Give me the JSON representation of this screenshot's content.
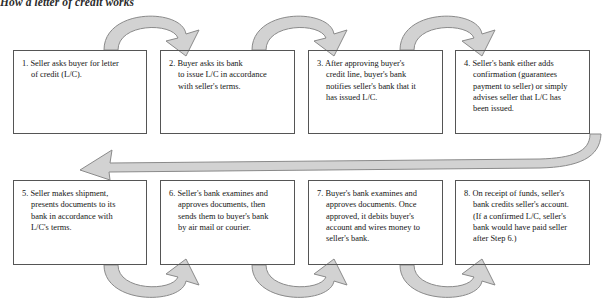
{
  "title": "How a letter of credit works",
  "colors": {
    "arrow_fill": "#d2d2d2",
    "arrow_stroke": "#8a8a8a",
    "box_border": "#555555",
    "text": "#141414",
    "background": "#ffffff"
  },
  "steps": [
    {
      "number": "1.",
      "text": "1. Seller asks buyer for letter\n of credit (L/C)."
    },
    {
      "number": "2.",
      "text": "2. Buyer asks its bank\n to issue L/C in accordance\n with seller's terms."
    },
    {
      "number": "3.",
      "text": "3. After approving buyer's\n credit line, buyer's bank\n notifies seller's bank that it\n has issued L/C."
    },
    {
      "number": "4.",
      "text": "4. Seller's bank either adds\n confirmation (guarantees\n payment to seller) or simply\n advises seller that L/C has\n been issued."
    },
    {
      "number": "5.",
      "text": "5. Seller makes shipment,\n presents documents to its\n bank in accordance with\n L/C's terms."
    },
    {
      "number": "6.",
      "text": "6. Seller's bank examines and\n approves documents, then\n sends them to buyer's bank\n by air mail or courier."
    },
    {
      "number": "7.",
      "text": "7. Buyer's bank examines and\n approves documents. Once\n approved, it debits buyer's\n account and wires money to\n seller's bank."
    },
    {
      "number": "8.",
      "text": "8. On receipt of funds, seller's\n bank credits seller's account.\n (If a confirmed L/C, seller's\n bank would have paid seller\n after Step 6.)"
    }
  ],
  "connectors": [
    {
      "name": "arrow-1-to-2",
      "from": "1",
      "to": "2",
      "shape": "arch-up",
      "direction": "right"
    },
    {
      "name": "arrow-2-to-3",
      "from": "2",
      "to": "3",
      "shape": "arch-up",
      "direction": "right"
    },
    {
      "name": "arrow-3-to-4",
      "from": "3",
      "to": "4",
      "shape": "arch-up",
      "direction": "right"
    },
    {
      "name": "arrow-4-to-5",
      "from": "4",
      "to": "5",
      "shape": "long-return",
      "direction": "left"
    },
    {
      "name": "arrow-5-to-6",
      "from": "5",
      "to": "6",
      "shape": "arch-down",
      "direction": "right"
    },
    {
      "name": "arrow-6-to-7",
      "from": "6",
      "to": "7",
      "shape": "arch-down",
      "direction": "right"
    },
    {
      "name": "arrow-7-to-8",
      "from": "7",
      "to": "8",
      "shape": "arch-down",
      "direction": "right"
    }
  ]
}
